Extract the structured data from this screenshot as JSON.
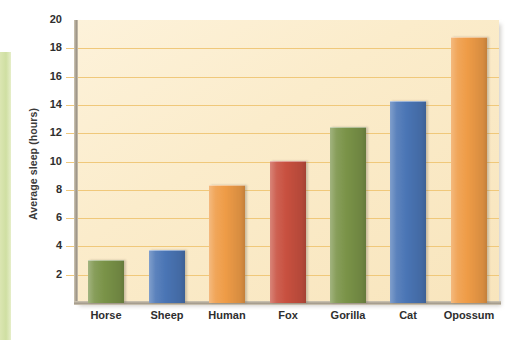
{
  "chart_data": {
    "type": "bar",
    "title": "",
    "xlabel": "",
    "ylabel": "Average sleep (hours)",
    "ylim": [
      0,
      20
    ],
    "yticks": [
      2,
      4,
      6,
      8,
      10,
      12,
      14,
      16,
      18,
      20
    ],
    "grid": true,
    "legend": "none",
    "categories": [
      "Horse",
      "Sheep",
      "Human",
      "Fox",
      "Gorilla",
      "Cat",
      "Opossum"
    ],
    "values": [
      3.0,
      3.65,
      8.3,
      9.95,
      12.35,
      14.2,
      18.75
    ],
    "bar_colors": [
      "#7a9348",
      "#4a75b5",
      "#ef9c47",
      "#c8503f",
      "#7a9348",
      "#4a75b5",
      "#ef9c47"
    ],
    "series": [
      {
        "name": "Average sleep (hours)",
        "values": [
          3.0,
          3.65,
          8.3,
          9.95,
          12.35,
          14.2,
          18.75
        ]
      }
    ]
  },
  "style": {
    "plot_background": "#fbeccb",
    "gridline_color": "#f0c87a",
    "axis_color": "#9d9486",
    "text_color": "#2e2e2e",
    "green": "#7a9348",
    "blue": "#4a75b5",
    "orange": "#ef9c47",
    "red": "#c8503f",
    "side_strip": "#cfdfa2"
  }
}
